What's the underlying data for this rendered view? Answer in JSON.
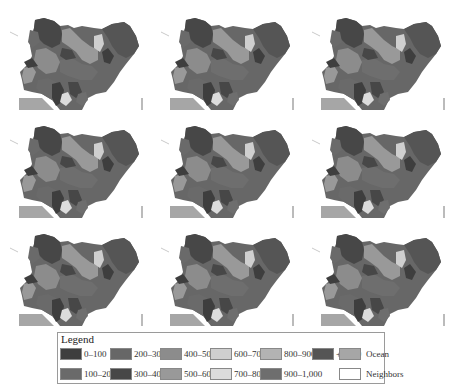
{
  "figure": {
    "panel_count": 9,
    "grid": {
      "rows": 3,
      "cols": 3
    },
    "map_subject": "Nigeria",
    "panels": [
      {
        "row": 0,
        "col": 0
      },
      {
        "row": 0,
        "col": 1
      },
      {
        "row": 0,
        "col": 2
      },
      {
        "row": 1,
        "col": 0
      },
      {
        "row": 1,
        "col": 1
      },
      {
        "row": 1,
        "col": 2
      },
      {
        "row": 2,
        "col": 0
      },
      {
        "row": 2,
        "col": 1
      },
      {
        "row": 2,
        "col": 2
      }
    ]
  },
  "legend": {
    "title": "Legend",
    "items": [
      {
        "label": "0–100",
        "color": "#3e3e3e"
      },
      {
        "label": "100–200",
        "color": "#6a6a6a"
      },
      {
        "label": "200–300",
        "color": "#676767"
      },
      {
        "label": "300–400",
        "color": "#474747"
      },
      {
        "label": "400–500",
        "color": "#8c8c8c"
      },
      {
        "label": "500–600",
        "color": "#999999"
      },
      {
        "label": "600–700",
        "color": "#cfcfcf"
      },
      {
        "label": "700–800",
        "color": "#dcdcdc"
      },
      {
        "label": "800–900",
        "color": "#b3b3b3"
      },
      {
        "label": "900–1,000",
        "color": "#6e6e6e"
      },
      {
        "label": "+1,000",
        "color": "#555555"
      },
      {
        "label": "Ocean",
        "color": "#a6a6a6"
      },
      {
        "label": "Neighbors",
        "color": "#ffffff"
      }
    ]
  },
  "colors": {
    "ocean": "#a6a6a6",
    "neighbors": "#ffffff",
    "border": "#9a9a9a"
  }
}
